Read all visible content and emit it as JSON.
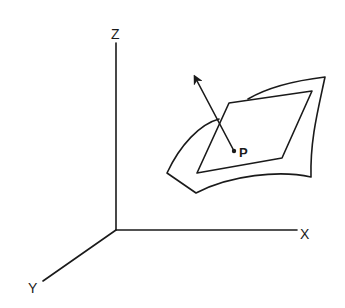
{
  "diagram": {
    "type": "3d-axes-with-surface-normal",
    "axes": {
      "z_label": "Z",
      "x_label": "X",
      "y_label": "Y",
      "origin": [
        116,
        230
      ],
      "z_end": [
        116,
        43
      ],
      "x_end": [
        297,
        230
      ],
      "y_end": [
        43,
        281
      ]
    },
    "surface": {
      "description": "curved surface patch",
      "outer_path": "M 167 173 C 185 140, 205 123, 219 119 M 248 99 C 270 86, 300 80, 325 77 C 318 110, 310 140, 311 177 C 280 170, 230 175, 196 193 Z",
      "outline": "M 167 173 L 196 193 C 230 175, 280 170, 311 177 C 310 140, 318 110, 325 77 C 300 80, 270 86, 248 99"
    },
    "tangent_plane": {
      "description": "tangent plane parallelogram at P",
      "corners": [
        [
          229,
          103
        ],
        [
          312,
          91
        ],
        [
          282,
          158
        ],
        [
          197,
          173
        ]
      ]
    },
    "normal_vector": {
      "description": "surface normal arrow through P",
      "start": [
        234,
        151
      ],
      "end": [
        194,
        75
      ]
    },
    "point": {
      "label": "P",
      "position": [
        234,
        151
      ]
    },
    "colors": {
      "ink": "#1a1a1a",
      "background": "#ffffff"
    }
  }
}
